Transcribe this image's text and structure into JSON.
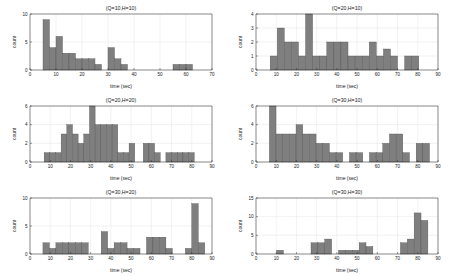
{
  "figure": {
    "name": "histogram-grid",
    "rows": 3,
    "cols": 2,
    "bar_color": "#7f7f7f",
    "bar_edge_color": "#4d4d4d",
    "grid_color": "#d9d9d9",
    "background": "#ffffff"
  },
  "chart_data": [
    {
      "id": "q10h10",
      "type": "bar",
      "title": "(Q=10,H=10)",
      "xlabel": "time (sec)",
      "ylabel": "count",
      "xlim": [
        0,
        70
      ],
      "ylim": [
        0,
        10
      ],
      "xticks": [
        0,
        10,
        20,
        30,
        40,
        50,
        60,
        70
      ],
      "yticks": [
        0,
        5,
        10
      ],
      "grid": true,
      "bin_width": 2.5,
      "bin_left_edges": [
        5,
        7.5,
        10,
        12.5,
        15,
        17.5,
        20,
        22.5,
        25,
        30,
        32.5,
        35,
        55,
        57.5,
        60
      ],
      "values": [
        9,
        4,
        6,
        3,
        3,
        2,
        2,
        2,
        1,
        4,
        2,
        1,
        1,
        1,
        1
      ]
    },
    {
      "id": "q20h10",
      "type": "bar",
      "title": "(Q=20,H=10)",
      "xlabel": "time (sec)",
      "ylabel": "count",
      "xlim": [
        0,
        90
      ],
      "ylim": [
        0,
        4
      ],
      "xticks": [
        0,
        10,
        20,
        30,
        40,
        50,
        60,
        70,
        80,
        90
      ],
      "yticks": [
        0,
        1,
        2,
        3,
        4
      ],
      "grid": true,
      "bin_width": 3.5,
      "bin_left_edges": [
        7,
        10.5,
        14,
        17.5,
        21,
        24.5,
        28,
        31.5,
        35,
        38.5,
        42,
        45.5,
        49,
        52.5,
        56,
        59.5,
        63,
        66.5,
        70,
        73.5,
        77
      ],
      "values": [
        1,
        3,
        2,
        2,
        1,
        4,
        1,
        1,
        2,
        2,
        2,
        1,
        1,
        1,
        2,
        1,
        1.5,
        1,
        0,
        1,
        1
      ]
    },
    {
      "id": "q20h20",
      "type": "bar",
      "title": "(Q=20,H=20)",
      "xlabel": "time (sec)",
      "ylabel": "count",
      "xlim": [
        0,
        90
      ],
      "ylim": [
        0,
        6
      ],
      "xticks": [
        0,
        10,
        20,
        30,
        40,
        50,
        60,
        70,
        80,
        90
      ],
      "yticks": [
        0,
        2,
        4,
        6
      ],
      "grid": true,
      "bin_width": 2.8,
      "bin_left_edges": [
        7,
        9.8,
        12.6,
        15.4,
        18.2,
        21,
        23.8,
        26.6,
        29.4,
        32.2,
        35,
        37.8,
        40.6,
        43.4,
        46.2,
        49,
        56,
        58.8,
        61.6,
        67.2,
        70,
        72.8,
        75.6,
        78.4
      ],
      "values": [
        1,
        1,
        1,
        3,
        4,
        3,
        2,
        3,
        6,
        4,
        4,
        4,
        4,
        1,
        1,
        2,
        2,
        2,
        1,
        1,
        1,
        1,
        1,
        1
      ]
    },
    {
      "id": "q30h10",
      "type": "bar",
      "title": "(Q=30,H=10)",
      "xlabel": "time (sec)",
      "ylabel": "count",
      "xlim": [
        0,
        90
      ],
      "ylim": [
        0,
        6
      ],
      "xticks": [
        0,
        10,
        20,
        30,
        40,
        50,
        60,
        70,
        80,
        90
      ],
      "yticks": [
        0,
        2,
        4,
        6
      ],
      "grid": true,
      "bin_width": 3.3,
      "bin_left_edges": [
        6.6,
        9.9,
        13.2,
        16.5,
        19.8,
        23.1,
        26.4,
        29.7,
        33,
        36.3,
        39.6,
        46.2,
        49.5,
        56.1,
        59.4,
        62.7,
        66,
        69.3,
        72.6,
        79.2,
        82.5
      ],
      "values": [
        6,
        3,
        3,
        3,
        4,
        3,
        3,
        2,
        2,
        1,
        1,
        1,
        1,
        1,
        1,
        2,
        3,
        3,
        1,
        2,
        2
      ]
    },
    {
      "id": "q30h20",
      "type": "bar",
      "title": "(Q=30,H=20)",
      "xlabel": "time (sec)",
      "ylabel": "count",
      "xlim": [
        0,
        90
      ],
      "ylim": [
        0,
        10
      ],
      "xticks": [
        0,
        10,
        20,
        30,
        40,
        50,
        60,
        70,
        80,
        90
      ],
      "yticks": [
        0,
        5,
        10
      ],
      "grid": true,
      "bin_width": 3.2,
      "bin_left_edges": [
        6.4,
        9.6,
        12.8,
        16,
        19.2,
        22.4,
        25.6,
        35.2,
        38.4,
        41.6,
        44.8,
        48,
        51.2,
        57.6,
        60.8,
        64,
        67.2,
        76.8,
        80,
        83.2
      ],
      "values": [
        2,
        1,
        2,
        2,
        2,
        2,
        2,
        4,
        1,
        2,
        2,
        1,
        1,
        3,
        3,
        3,
        1,
        1,
        9,
        2
      ]
    },
    {
      "id": "q30h30",
      "type": "bar",
      "title": "(Q=30,H=30)",
      "xlabel": "time (sec)",
      "ylabel": "count",
      "xlim": [
        0,
        90
      ],
      "ylim": [
        0,
        15
      ],
      "xticks": [
        0,
        10,
        20,
        30,
        40,
        50,
        60,
        70,
        80,
        90
      ],
      "yticks": [
        0,
        5,
        10,
        15
      ],
      "grid": true,
      "bin_width": 3.4,
      "bin_left_edges": [
        10.2,
        27.2,
        30.6,
        34,
        40.8,
        44.2,
        47.6,
        51,
        54.4,
        71.4,
        74.8,
        78.2,
        81.6
      ],
      "values": [
        1,
        3,
        3,
        4,
        1,
        1,
        1,
        3,
        2,
        3,
        4,
        11,
        9
      ]
    }
  ]
}
